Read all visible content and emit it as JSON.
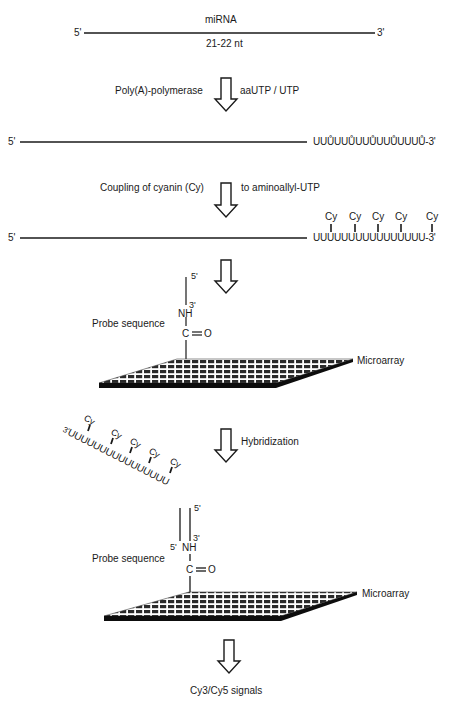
{
  "diagram": {
    "title_step1": {
      "molecule": "miRNA",
      "length": "21-22 nt",
      "end5": "5'",
      "end3": "3'"
    },
    "step2": {
      "enzyme": "Poly(A)-polymerase",
      "substrate": "aaUTP / UTP",
      "end5": "5'",
      "tail": "UUŮUUŮUUŮUUŮUUUŮ-3'",
      "tail_units": [
        "U",
        "U",
        "U*",
        "U",
        "U",
        "U*",
        "U",
        "U",
        "U*",
        "U",
        "U",
        "U*",
        "U",
        "U",
        "U",
        "U*"
      ],
      "tail_suffix": "-3'"
    },
    "step3": {
      "label_left": "Coupling of cyanin (Cy)",
      "label_right": "to aminoallyl-UTP",
      "end5": "5'",
      "tail": "UUUUUUUUUUUUUUUU",
      "tail_suffix": "-3'",
      "dye": "Cy",
      "dye_count": 5
    },
    "step4": {
      "probe_label": "Probe sequence",
      "probe_5": "5'",
      "probe_3": "3'",
      "nh": "NH",
      "carbonyl_c": "C",
      "carbonyl_o": "O",
      "array_label": "Microarray"
    },
    "step5": {
      "process": "Hybridization",
      "target_3": "3'",
      "target_tail": "UUUUUUUUUUUUUUUU",
      "dye": "Cy",
      "probe_label": "Probe sequence",
      "strand_5_top": "5'",
      "strand_5_bottom": "5'",
      "strand_3": "3'",
      "nh": "NH",
      "carbonyl_c": "C",
      "carbonyl_o": "O",
      "array_label": "Microarray"
    },
    "final": {
      "output": "Cy3/Cy5 signals"
    },
    "colors": {
      "ink": "#1a1a1a",
      "background": "#ffffff"
    }
  }
}
